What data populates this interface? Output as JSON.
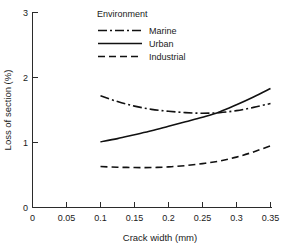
{
  "chart_data": {
    "type": "line",
    "title": "",
    "xlabel": "Crack width (mm)",
    "ylabel": "Loss of section (%)",
    "xlim": [
      0,
      0.35
    ],
    "ylim": [
      0,
      3
    ],
    "xticks": [
      "0",
      "0.05",
      "0.1",
      "0.15",
      "0.2",
      "0.25",
      "0.3",
      "0.35"
    ],
    "xtick_values": [
      0,
      0.05,
      0.1,
      0.15,
      0.2,
      0.25,
      0.3,
      0.35
    ],
    "yticks": [
      "0",
      "1",
      "2",
      "3"
    ],
    "ytick_values": [
      0,
      1,
      2,
      3
    ],
    "grid": false,
    "legend_position": "top-center",
    "legend_title": "Environment",
    "x": [
      0.1,
      0.125,
      0.15,
      0.175,
      0.2,
      0.225,
      0.25,
      0.275,
      0.3,
      0.325,
      0.35
    ],
    "series": [
      {
        "name": "Marine",
        "style": "dash-dot",
        "dasharray": "9,3,2,3",
        "values": [
          1.72,
          1.63,
          1.56,
          1.51,
          1.48,
          1.46,
          1.45,
          1.46,
          1.49,
          1.54,
          1.6
        ]
      },
      {
        "name": "Urban",
        "style": "solid",
        "dasharray": "",
        "values": [
          1.01,
          1.06,
          1.12,
          1.18,
          1.25,
          1.32,
          1.39,
          1.47,
          1.58,
          1.7,
          1.83
        ]
      },
      {
        "name": "Industrial",
        "style": "dashed",
        "dasharray": "7,4",
        "values": [
          0.63,
          0.62,
          0.615,
          0.615,
          0.625,
          0.645,
          0.675,
          0.715,
          0.775,
          0.855,
          0.95
        ]
      }
    ]
  },
  "legend": {
    "title": "Environment",
    "items": [
      {
        "label": "Marine"
      },
      {
        "label": "Urban"
      },
      {
        "label": "Industrial"
      }
    ]
  },
  "axes": {
    "x_title": "Crack width (mm)",
    "y_title": "Loss of section (%)"
  },
  "colors": {
    "line": "#111111",
    "axis": "#2b2b2b",
    "background": "#ffffff",
    "text": "#1a1a1a"
  }
}
